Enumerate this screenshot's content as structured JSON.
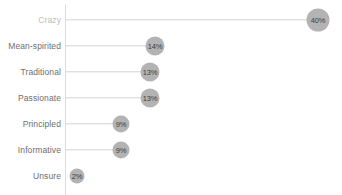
{
  "chart_data": {
    "type": "bar",
    "title": "",
    "xlabel": "",
    "ylabel": "",
    "grid": false,
    "legend": null,
    "xlim": [
      0,
      42
    ],
    "categories": [
      "Crazy",
      "Mean-spirited",
      "Traditional",
      "Passionate",
      "Principled",
      "Informative",
      "Unsure"
    ],
    "values": [
      40,
      14,
      13,
      13,
      9,
      9,
      2
    ],
    "value_labels": [
      "40%",
      "14%",
      "13%",
      "13%",
      "9%",
      "9%",
      "2%"
    ],
    "series": [
      {
        "name": "Share of responses",
        "values": [
          40,
          14,
          13,
          13,
          9,
          9,
          2
        ]
      }
    ]
  },
  "rows": [
    {
      "label": "Crazy",
      "value_label": "40%",
      "value": 40,
      "x": 318,
      "y": 20,
      "size": 23,
      "muted": true,
      "line_width": 249,
      "has_line": true
    },
    {
      "label": "Mean-spirited",
      "value_label": "14%",
      "value": 14,
      "x": 155,
      "y": 46,
      "size": 19,
      "muted": false,
      "line_width": 86,
      "has_line": true
    },
    {
      "label": "Traditional",
      "value_label": "13%",
      "value": 13,
      "x": 150,
      "y": 72,
      "size": 19,
      "muted": false,
      "line_width": 81,
      "has_line": true
    },
    {
      "label": "Passionate",
      "value_label": "13%",
      "value": 13,
      "x": 150,
      "y": 98,
      "size": 19,
      "muted": false,
      "line_width": 81,
      "has_line": true
    },
    {
      "label": "Principled",
      "value_label": "9%",
      "value": 9,
      "x": 121,
      "y": 124,
      "size": 17,
      "muted": false,
      "line_width": 52,
      "has_line": true
    },
    {
      "label": "Informative",
      "value_label": "9%",
      "value": 9,
      "x": 121,
      "y": 150,
      "size": 17,
      "muted": false,
      "line_width": 52,
      "has_line": true
    },
    {
      "label": "Unsure",
      "value_label": "2%",
      "value": 2,
      "x": 77,
      "y": 176,
      "size": 15,
      "muted": false,
      "line_width": 0,
      "has_line": false
    }
  ],
  "colors": {
    "bubble": "#b3b3b3",
    "connector": "#d3d3d3",
    "axis": "#dcdcdc",
    "label": "#6e6e6e",
    "label_muted": "#bdbdbd",
    "bubble_text": "#3d3d3d",
    "background": "#ffffff"
  }
}
